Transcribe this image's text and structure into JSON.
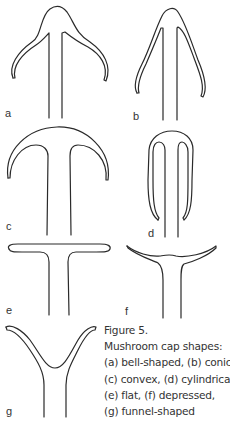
{
  "figure": {
    "panels": [
      {
        "id": "a",
        "label": "a",
        "shape": "bell-shaped"
      },
      {
        "id": "b",
        "label": "b",
        "shape": "conical"
      },
      {
        "id": "c",
        "label": "c",
        "shape": "convex"
      },
      {
        "id": "d",
        "label": "d",
        "shape": "cylindrical"
      },
      {
        "id": "e",
        "label": "e",
        "shape": "flat"
      },
      {
        "id": "f",
        "label": "f",
        "shape": "depressed"
      },
      {
        "id": "g",
        "label": "g",
        "shape": "funnel-shaped"
      }
    ],
    "caption": {
      "title": "Figure 5.",
      "lines": [
        "Mushroom cap shapes:",
        "(a) bell-shaped, (b) conical,",
        "(c) convex, (d) cylindrical,",
        "(e) flat, (f) depressed,",
        "(g) funnel-shaped"
      ]
    },
    "colors": {
      "stroke": "#2a2a2a",
      "text": "#333333",
      "background": "#ffffff"
    }
  }
}
